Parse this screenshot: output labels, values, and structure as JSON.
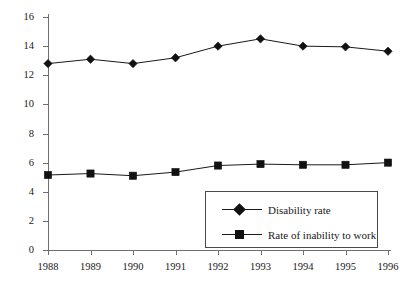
{
  "chart_data": {
    "type": "line",
    "title": "",
    "xlabel": "",
    "ylabel": "Percent",
    "grid": false,
    "legend_position": "inside-bottom-right",
    "x": [
      "1988",
      "1989",
      "1990",
      "1991",
      "1992",
      "1993",
      "1994",
      "1995",
      "1996"
    ],
    "categories": [
      "1988",
      "1989",
      "1990",
      "1991",
      "1992",
      "1993",
      "1994",
      "1995",
      "1996"
    ],
    "ylim": [
      0,
      16
    ],
    "ytick_step": 2,
    "yticks": [
      "16",
      "14",
      "12",
      "10",
      "8",
      "6",
      "4",
      "2",
      "0"
    ],
    "ytick_values": [
      16,
      14,
      12,
      10,
      8,
      6,
      4,
      2,
      0
    ],
    "series": [
      {
        "name": "Disability rate",
        "marker": "diamond",
        "color": "#111111",
        "values": [
          12.8,
          13.1,
          12.8,
          13.2,
          14.0,
          14.5,
          14.0,
          13.95,
          13.65
        ]
      },
      {
        "name": "Rate of inability to work",
        "marker": "square",
        "color": "#111111",
        "values": [
          5.15,
          5.25,
          5.1,
          5.35,
          5.8,
          5.9,
          5.85,
          5.85,
          6.0
        ]
      }
    ]
  },
  "legend": {
    "entries": [
      {
        "label": "Disability rate",
        "marker": "diamond"
      },
      {
        "label": "Rate of inability to work",
        "marker": "square"
      }
    ]
  },
  "axes": {
    "y_title": "Percent"
  },
  "colors": {
    "axis": "#6f6f6f",
    "ink": "#1a1a1a",
    "marker": "#111111",
    "background": "#ffffff"
  }
}
